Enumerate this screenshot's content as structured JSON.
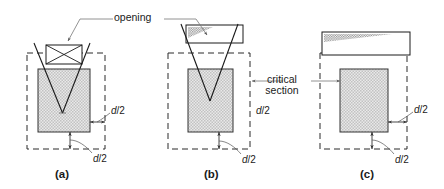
{
  "figure": {
    "title_text": "",
    "annotations": {
      "opening_label": "opening",
      "critical_section_label_line1": "critical",
      "critical_section_label_line2": "section"
    },
    "dimension_label": "d/2",
    "dimension_label_italic_part": "d",
    "dimension_label_plain_part": "/2",
    "panels": [
      {
        "id": "a",
        "caption": "(a)",
        "opening_type": "small-rectangular-opening-with-crossed-diagonals",
        "dimensions": [
          "d/2",
          "d/2"
        ]
      },
      {
        "id": "b",
        "caption": "(b)",
        "opening_type": "wide-rectangular-opening-with-hatched-corner",
        "dimensions": [
          "d/2",
          "d/2"
        ]
      },
      {
        "id": "c",
        "caption": "(c)",
        "opening_type": "large-rectangular-opening-with-hatched-corner",
        "dimensions": [
          "d/2",
          "d/2"
        ]
      }
    ],
    "colors": {
      "line": "#1a1a1a",
      "dashed_line": "#2b2b2b",
      "leader_line": "#666666",
      "column_fill": "#d2d2d2",
      "opening_hatch": "#9a9a9a",
      "background": "#ffffff"
    }
  }
}
